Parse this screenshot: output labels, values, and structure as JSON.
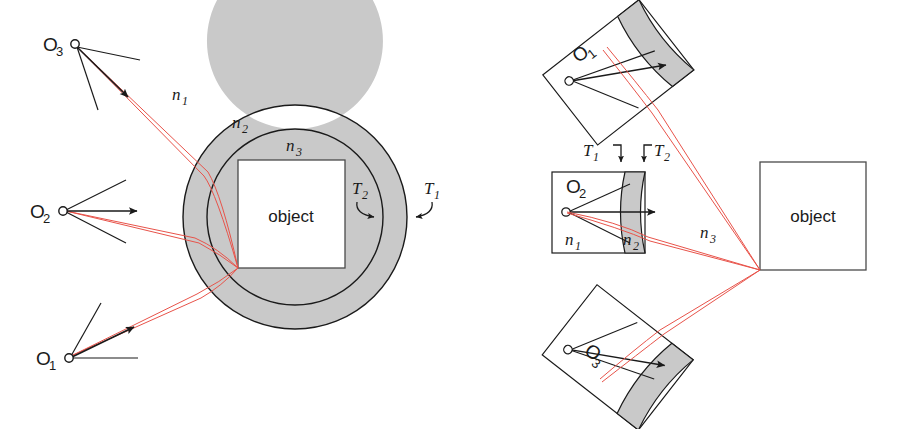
{
  "figure": {
    "background_color": "#ffffff",
    "ray_color": "#e8534a",
    "line_color": "#1a1a1a",
    "band_fill_color": "#c9c9c9",
    "band_stroke_color": "#1a1a1a",
    "object_box_stroke": "#4a4a4a"
  },
  "left_panel": {
    "name": "annular-geometry-panel",
    "object_label": "object",
    "refractive_indices": [
      {
        "id": "n1",
        "base": "n",
        "sub": "1",
        "desc": "outer medium index"
      },
      {
        "id": "n2",
        "base": "n",
        "sub": "2",
        "desc": "shell medium index"
      },
      {
        "id": "n3",
        "base": "n",
        "sub": "3",
        "desc": "inner medium index"
      }
    ],
    "thicknesses": [
      {
        "id": "T1",
        "base": "T",
        "sub": "1",
        "desc": "outer boundary marker"
      },
      {
        "id": "T2",
        "base": "T",
        "sub": "2",
        "desc": "inner boundary marker"
      }
    ],
    "sources": [
      {
        "id": "O3",
        "base": "O",
        "sub": "3",
        "x": 75,
        "y": 44
      },
      {
        "id": "O2",
        "base": "O",
        "sub": "2",
        "x": 63,
        "y": 210
      },
      {
        "id": "O1",
        "base": "O",
        "sub": "1",
        "x": 69,
        "y": 358
      }
    ],
    "annulus": {
      "cx": 295,
      "cy": 217,
      "r_outer": 112,
      "r_inner": 88
    },
    "object_box": {
      "x": 238,
      "y": 160,
      "w": 107,
      "h": 108
    },
    "convergence_point": {
      "x": 238,
      "y": 268
    }
  },
  "right_panel": {
    "name": "unfolded-slab-panel",
    "object_label": "object",
    "refractive_indices": [
      {
        "id": "n1",
        "base": "n",
        "sub": "1",
        "desc": "slab interior index"
      },
      {
        "id": "n2",
        "base": "n",
        "sub": "2",
        "desc": "curved band index"
      },
      {
        "id": "n3",
        "base": "n",
        "sub": "3",
        "desc": "propagation space index"
      }
    ],
    "thicknesses": [
      {
        "id": "T1",
        "base": "T",
        "sub": "1",
        "desc": "first interface marker"
      },
      {
        "id": "T2",
        "base": "T",
        "sub": "2",
        "desc": "second interface marker"
      }
    ],
    "sources": [
      {
        "id": "O1",
        "base": "O",
        "sub": "1",
        "rotation_deg": -38
      },
      {
        "id": "O2",
        "base": "O",
        "sub": "2",
        "rotation_deg": 0
      },
      {
        "id": "O3",
        "base": "O",
        "sub": "3",
        "rotation_deg": 38
      }
    ],
    "object_box": {
      "x": 760,
      "y": 162,
      "w": 106,
      "h": 108
    },
    "convergence_point": {
      "x": 760,
      "y": 270
    }
  }
}
